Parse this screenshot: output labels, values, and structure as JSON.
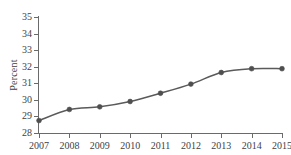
{
  "chart_data": {
    "type": "line",
    "title": "",
    "xlabel": "",
    "ylabel": "Percent",
    "x": [
      2007,
      2008,
      2009,
      2010,
      2011,
      2012,
      2013,
      2014,
      2015
    ],
    "categories": [
      "2007",
      "2008",
      "2009",
      "2010",
      "2011",
      "2012",
      "2013",
      "2014",
      "2015"
    ],
    "values": [
      28.75,
      29.42,
      29.58,
      29.9,
      30.4,
      30.95,
      31.65,
      31.88,
      31.88
    ],
    "series": [
      {
        "name": "Percent",
        "values": [
          28.75,
          29.42,
          29.58,
          29.9,
          30.4,
          30.95,
          31.65,
          31.88,
          31.88
        ]
      }
    ],
    "ylim": [
      28,
      35
    ],
    "yticks": [
      28,
      29,
      30,
      31,
      32,
      33,
      34,
      35
    ],
    "ytick_labels": [
      "28",
      "29",
      "30",
      "31",
      "32",
      "33",
      "34",
      "35"
    ],
    "xlim": [
      2007,
      2015
    ],
    "xticks": [
      2007,
      2008,
      2009,
      2010,
      2011,
      2012,
      2013,
      2014,
      2015
    ],
    "xtick_labels": [
      "2007",
      "2008",
      "2009",
      "2010",
      "2011",
      "2012",
      "2013",
      "2014",
      "2015"
    ],
    "grid": false,
    "legend": null,
    "legend_position": "none",
    "marker": "circle",
    "colors": {
      "line": "#5a5a5a",
      "marker": "#4f4f4f",
      "axis": "#6a6a6a",
      "text": "#3f3f3f",
      "background": "#ffffff"
    }
  }
}
